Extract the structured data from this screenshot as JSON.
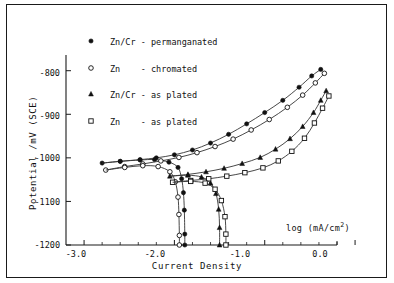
{
  "chart_data": {
    "type": "line",
    "title": "",
    "xlabel": "Current Density",
    "ylabel": "Potential /mV (SCE)",
    "axis_note": "log (mA/cm2)",
    "axis_note_base": "log (mA/cm",
    "axis_note_sup": "2",
    "axis_note_tail": ")",
    "xlim": [
      -3.2,
      -0.2
    ],
    "ylim": [
      -1200,
      -780
    ],
    "xticks": [
      -3.0,
      -2.0,
      -1.0,
      0.0
    ],
    "xticklabels": [
      "-3.0",
      "-2.0",
      "-1.0",
      "0.0"
    ],
    "yticks": [
      -800,
      -900,
      -1000,
      -1100,
      -1200
    ],
    "yticklabels": [
      "-800",
      "-900",
      "-1000",
      "-1100",
      "-1200"
    ],
    "grid": false,
    "legend_position": "upper-left",
    "series": [
      {
        "name": "Zn/Cr - permanganated",
        "marker": "filled-circle",
        "points": [
          [
            -2.8,
            -1012
          ],
          [
            -2.6,
            -1008
          ],
          [
            -2.38,
            -1005
          ],
          [
            -2.22,
            -1004
          ],
          [
            -2.06,
            -1010
          ],
          [
            -1.96,
            -1022
          ],
          [
            -1.92,
            -1048
          ],
          [
            -1.9,
            -1080
          ],
          [
            -1.89,
            -1120
          ],
          [
            -1.885,
            -1175
          ],
          [
            -1.885,
            -1200
          ]
        ],
        "anodic_points": [
          [
            -2.8,
            -1012
          ],
          [
            -2.6,
            -1008
          ],
          [
            -2.38,
            -1004
          ],
          [
            -2.2,
            -1000
          ],
          [
            -2.0,
            -993
          ],
          [
            -1.8,
            -982
          ],
          [
            -1.6,
            -966
          ],
          [
            -1.4,
            -946
          ],
          [
            -1.2,
            -922
          ],
          [
            -1.0,
            -896
          ],
          [
            -0.8,
            -868
          ],
          [
            -0.62,
            -838
          ],
          [
            -0.48,
            -812
          ],
          [
            -0.38,
            -797
          ]
        ]
      },
      {
        "name": "Zn - chromated",
        "marker": "open-circle",
        "points": [
          [
            -2.76,
            -1028
          ],
          [
            -2.55,
            -1022
          ],
          [
            -2.35,
            -1018
          ],
          [
            -2.18,
            -1020
          ],
          [
            -2.05,
            -1032
          ],
          [
            -1.99,
            -1055
          ],
          [
            -1.96,
            -1090
          ],
          [
            -1.95,
            -1130
          ],
          [
            -1.945,
            -1178
          ],
          [
            -1.945,
            -1200
          ]
        ],
        "anodic_points": [
          [
            -2.76,
            -1028
          ],
          [
            -2.55,
            -1020
          ],
          [
            -2.35,
            -1014
          ],
          [
            -2.15,
            -1007
          ],
          [
            -1.95,
            -999
          ],
          [
            -1.75,
            -988
          ],
          [
            -1.55,
            -974
          ],
          [
            -1.35,
            -957
          ],
          [
            -1.15,
            -936
          ],
          [
            -0.95,
            -912
          ],
          [
            -0.75,
            -884
          ],
          [
            -0.58,
            -856
          ],
          [
            -0.44,
            -828
          ],
          [
            -0.34,
            -806
          ]
        ]
      },
      {
        "name": "Zn/Cr - as plated",
        "marker": "filled-triangle",
        "points": [
          [
            -2.05,
            -1042
          ],
          [
            -1.85,
            -1040
          ],
          [
            -1.7,
            -1044
          ],
          [
            -1.6,
            -1058
          ],
          [
            -1.54,
            -1082
          ],
          [
            -1.51,
            -1118
          ],
          [
            -1.5,
            -1160
          ],
          [
            -1.5,
            -1200
          ]
        ],
        "anodic_points": [
          [
            -2.05,
            -1042
          ],
          [
            -1.85,
            -1038
          ],
          [
            -1.65,
            -1032
          ],
          [
            -1.45,
            -1024
          ],
          [
            -1.25,
            -1013
          ],
          [
            -1.05,
            -999
          ],
          [
            -0.88,
            -980
          ],
          [
            -0.72,
            -956
          ],
          [
            -0.58,
            -928
          ],
          [
            -0.46,
            -896
          ],
          [
            -0.38,
            -868
          ],
          [
            -0.32,
            -846
          ]
        ]
      },
      {
        "name": "Zn - as plated",
        "marker": "open-square",
        "points": [
          [
            -2.02,
            -1056
          ],
          [
            -1.82,
            -1054
          ],
          [
            -1.66,
            -1058
          ],
          [
            -1.55,
            -1072
          ],
          [
            -1.48,
            -1098
          ],
          [
            -1.44,
            -1135
          ],
          [
            -1.43,
            -1175
          ],
          [
            -1.43,
            -1200
          ]
        ],
        "anodic_points": [
          [
            -2.02,
            -1056
          ],
          [
            -1.82,
            -1052
          ],
          [
            -1.62,
            -1048
          ],
          [
            -1.42,
            -1042
          ],
          [
            -1.22,
            -1034
          ],
          [
            -1.02,
            -1023
          ],
          [
            -0.85,
            -1007
          ],
          [
            -0.7,
            -985
          ],
          [
            -0.56,
            -955
          ],
          [
            -0.45,
            -920
          ],
          [
            -0.36,
            -886
          ],
          [
            -0.29,
            -858
          ]
        ]
      }
    ]
  },
  "legend": {
    "items": [
      {
        "marker": "filled-circle",
        "label": "Zn/Cr - permanganated"
      },
      {
        "marker": "open-circle",
        "label": "Zn    - chromated"
      },
      {
        "marker": "filled-triangle",
        "label": "Zn/Cr - as plated"
      },
      {
        "marker": "open-square",
        "label": "Zn    - as plated"
      }
    ]
  },
  "colors": {
    "axis": "#1a1a1a",
    "curve": "#333333",
    "frame": "#1a1a1a",
    "background": "#ffffff"
  }
}
